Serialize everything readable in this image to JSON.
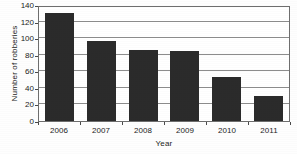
{
  "chart_data": {
    "type": "bar",
    "title": "",
    "subtitle": "",
    "xlabel": "Year",
    "ylabel": "Number of robberies",
    "categories": [
      "2006",
      "2007",
      "2008",
      "2009",
      "2010",
      "2011"
    ],
    "values": [
      130,
      97,
      86,
      84,
      53,
      30
    ],
    "series": [
      {
        "name": "Number of robberies",
        "values": [
          130,
          97,
          86,
          84,
          53,
          30
        ]
      }
    ],
    "ylim": [
      0,
      140
    ],
    "ytick_labels": [
      "0",
      "20",
      "40",
      "60",
      "80",
      "100",
      "120",
      "140"
    ],
    "ytick_values": [
      0,
      20,
      40,
      60,
      80,
      100,
      120,
      140
    ],
    "grid": "horizontal",
    "legend": "none",
    "bar_color": "#2b2b2b",
    "gridline_color": "#8d8d8d",
    "axis_color": "#6e6e6e",
    "background_color": "#ffffff",
    "annotations": []
  }
}
